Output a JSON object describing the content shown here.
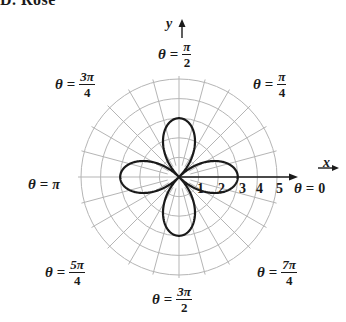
{
  "title": "D. Rose",
  "axes": {
    "x_label": "x",
    "y_label": "y"
  },
  "ticks": [
    "1",
    "2",
    "3",
    "4",
    "5"
  ],
  "angle_labels": {
    "zero": {
      "theta": "θ",
      "eq": "=",
      "value": "0"
    },
    "pi_over_4": {
      "theta": "θ",
      "eq": "=",
      "num": "π",
      "den": "4"
    },
    "pi_over_2": {
      "theta": "θ",
      "eq": "=",
      "num": "π",
      "den": "2"
    },
    "3pi_over_4": {
      "theta": "θ",
      "eq": "=",
      "num": "3π",
      "den": "4"
    },
    "pi": {
      "theta": "θ",
      "eq": "=",
      "value": "π"
    },
    "5pi_over_4": {
      "theta": "θ",
      "eq": "=",
      "num": "5π",
      "den": "4"
    },
    "3pi_over_2": {
      "theta": "θ",
      "eq": "=",
      "num": "3π",
      "den": "2"
    },
    "7pi_over_4": {
      "theta": "θ",
      "eq": "=",
      "num": "7π",
      "den": "4"
    }
  },
  "chart_data": {
    "type": "polar",
    "title": "Rose",
    "curve": "four-petal rose, petals along the axes, max radius 3",
    "equation_implied": "r = 3 cos(2θ)",
    "petal_count": 4,
    "max_radius": 3,
    "radial_ticks": [
      1,
      2,
      3,
      4,
      5
    ],
    "radial_range": [
      0,
      5
    ],
    "angular_grid_step_deg": 15,
    "angle_labels": [
      "0",
      "π/4",
      "π/2",
      "3π/4",
      "π",
      "5π/4",
      "3π/2",
      "7π/4"
    ],
    "grid": true
  },
  "colors": {
    "curve": "#1a1a1a",
    "grid": "#b5b5b5",
    "axis": "#1a1a1a"
  }
}
